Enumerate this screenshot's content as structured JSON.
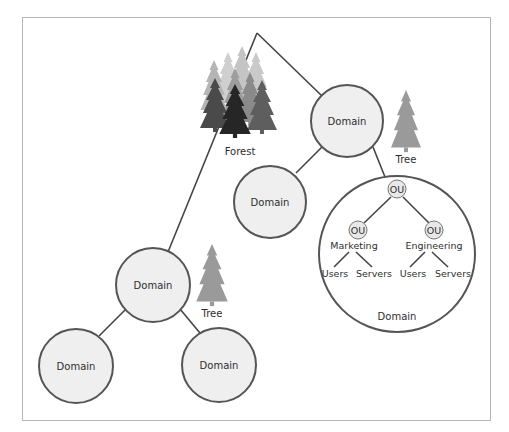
{
  "forest": {
    "label": "Forest"
  },
  "trees": [
    {
      "label": "Tree"
    },
    {
      "label": "Tree"
    }
  ],
  "domains": {
    "top_right": {
      "label": "Domain"
    },
    "mid_right": {
      "label": "Domain"
    },
    "mid_left": {
      "label": "Domain"
    },
    "bottom_left": {
      "label": "Domain"
    },
    "bottom_right": {
      "label": "Domain"
    },
    "expanded": {
      "label": "Domain",
      "root_ou": {
        "label": "OU"
      },
      "ous": [
        {
          "label": "OU",
          "name": "Marketing",
          "children": [
            "Users",
            "Servers"
          ]
        },
        {
          "label": "OU",
          "name": "Engineering",
          "children": [
            "Users",
            "Servers"
          ]
        }
      ]
    }
  },
  "colors": {
    "node_fill": "#efefef",
    "node_stroke": "#555555",
    "tree_gray": "#9a9a9a",
    "forest_dark": "#2a2a2a"
  }
}
